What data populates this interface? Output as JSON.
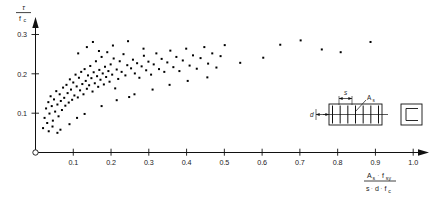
{
  "figure": {
    "background": "#ffffff",
    "ink": "#111111"
  },
  "axes": {
    "y_axis": {
      "label_numerator": "τ",
      "label_denominator": "f'c",
      "label_denominator_main": "f",
      "label_denominator_sub": "c",
      "ticks": [
        "0.1",
        "0.2",
        "0.3"
      ],
      "tick_values": [
        0.1,
        0.2,
        0.3
      ],
      "range": [
        0.0,
        0.33
      ],
      "arrow": true
    },
    "x_axis": {
      "label_num_a": "A",
      "label_num_a_sub": "s",
      "label_num_dot": "·",
      "label_num_f": "f",
      "label_num_f_sub": "sy",
      "label_den_s": "s",
      "label_den_d": "d",
      "label_den_f": "f",
      "label_den_f_sub": "c",
      "ticks": [
        "0.1",
        "0.2",
        "0.3",
        "0.4",
        "0.5",
        "0.6",
        "0.7",
        "0.8",
        "0.9",
        "1.0"
      ],
      "tick_values": [
        0.1,
        0.2,
        0.3,
        0.4,
        0.5,
        0.6,
        0.7,
        0.8,
        0.9,
        1.0
      ],
      "range": [
        0.0,
        1.05
      ],
      "arrow": true
    },
    "origin_marker": "open-circle"
  },
  "inset": {
    "spacing_label": "s",
    "area_label_main": "A",
    "area_label_sub": "s",
    "depth_label": "d",
    "stirrup_count": 7,
    "description": "beam elevation with stirrups and square cross-section"
  },
  "chart_data": {
    "type": "scatter",
    "title": "",
    "xlabel": "As · fsy / (s · d · f'c)",
    "ylabel": "τ / f'c",
    "xlim": [
      0.0,
      1.05
    ],
    "ylim": [
      0.0,
      0.33
    ],
    "grid": false,
    "legend": null,
    "marker": "square",
    "marker_size_px": 2.0,
    "series": [
      {
        "name": "test data",
        "color": "#000000",
        "points": [
          [
            0.02,
            0.062
          ],
          [
            0.024,
            0.088
          ],
          [
            0.028,
            0.112
          ],
          [
            0.031,
            0.075
          ],
          [
            0.034,
            0.128
          ],
          [
            0.037,
            0.099
          ],
          [
            0.04,
            0.143
          ],
          [
            0.043,
            0.118
          ],
          [
            0.046,
            0.081
          ],
          [
            0.049,
            0.135
          ],
          [
            0.052,
            0.104
          ],
          [
            0.055,
            0.156
          ],
          [
            0.058,
            0.122
          ],
          [
            0.061,
            0.092
          ],
          [
            0.064,
            0.148
          ],
          [
            0.067,
            0.131
          ],
          [
            0.07,
            0.108
          ],
          [
            0.073,
            0.165
          ],
          [
            0.076,
            0.139
          ],
          [
            0.079,
            0.119
          ],
          [
            0.082,
            0.172
          ],
          [
            0.085,
            0.151
          ],
          [
            0.088,
            0.127
          ],
          [
            0.091,
            0.186
          ],
          [
            0.094,
            0.16
          ],
          [
            0.097,
            0.134
          ],
          [
            0.1,
            0.178
          ],
          [
            0.103,
            0.145
          ],
          [
            0.106,
            0.198
          ],
          [
            0.109,
            0.168
          ],
          [
            0.112,
            0.14
          ],
          [
            0.115,
            0.19
          ],
          [
            0.118,
            0.158
          ],
          [
            0.121,
            0.205
          ],
          [
            0.124,
            0.174
          ],
          [
            0.127,
            0.148
          ],
          [
            0.13,
            0.212
          ],
          [
            0.133,
            0.182
          ],
          [
            0.136,
            0.162
          ],
          [
            0.139,
            0.196
          ],
          [
            0.142,
            0.171
          ],
          [
            0.145,
            0.22
          ],
          [
            0.148,
            0.189
          ],
          [
            0.151,
            0.155
          ],
          [
            0.154,
            0.204
          ],
          [
            0.157,
            0.176
          ],
          [
            0.16,
            0.232
          ],
          [
            0.163,
            0.194
          ],
          [
            0.166,
            0.167
          ],
          [
            0.169,
            0.21
          ],
          [
            0.172,
            0.185
          ],
          [
            0.175,
            0.243
          ],
          [
            0.178,
            0.201
          ],
          [
            0.181,
            0.173
          ],
          [
            0.184,
            0.218
          ],
          [
            0.187,
            0.192
          ],
          [
            0.19,
            0.255
          ],
          [
            0.193,
            0.207
          ],
          [
            0.196,
            0.18
          ],
          [
            0.199,
            0.224
          ],
          [
            0.203,
            0.198
          ],
          [
            0.207,
            0.239
          ],
          [
            0.211,
            0.163
          ],
          [
            0.215,
            0.211
          ],
          [
            0.219,
            0.187
          ],
          [
            0.223,
            0.232
          ],
          [
            0.228,
            0.205
          ],
          [
            0.233,
            0.25
          ],
          [
            0.238,
            0.196
          ],
          [
            0.243,
            0.222
          ],
          [
            0.248,
            0.141
          ],
          [
            0.253,
            0.214
          ],
          [
            0.258,
            0.236
          ],
          [
            0.263,
            0.201
          ],
          [
            0.269,
            0.227
          ],
          [
            0.275,
            0.19
          ],
          [
            0.281,
            0.219
          ],
          [
            0.287,
            0.246
          ],
          [
            0.293,
            0.209
          ],
          [
            0.299,
            0.231
          ],
          [
            0.306,
            0.198
          ],
          [
            0.313,
            0.224
          ],
          [
            0.32,
            0.252
          ],
          [
            0.327,
            0.212
          ],
          [
            0.334,
            0.238
          ],
          [
            0.341,
            0.205
          ],
          [
            0.349,
            0.229
          ],
          [
            0.357,
            0.259
          ],
          [
            0.365,
            0.217
          ],
          [
            0.373,
            0.243
          ],
          [
            0.381,
            0.207
          ],
          [
            0.39,
            0.234
          ],
          [
            0.399,
            0.264
          ],
          [
            0.408,
            0.221
          ],
          [
            0.417,
            0.247
          ],
          [
            0.427,
            0.213
          ],
          [
            0.437,
            0.24
          ],
          [
            0.447,
            0.268
          ],
          [
            0.457,
            0.226
          ],
          [
            0.468,
            0.252
          ],
          [
            0.479,
            0.216
          ],
          [
            0.49,
            0.245
          ],
          [
            0.501,
            0.273
          ],
          [
            0.113,
            0.252
          ],
          [
            0.136,
            0.268
          ],
          [
            0.152,
            0.281
          ],
          [
            0.168,
            0.258
          ],
          [
            0.205,
            0.272
          ],
          [
            0.245,
            0.283
          ],
          [
            0.286,
            0.264
          ],
          [
            0.058,
            0.05
          ],
          [
            0.066,
            0.058
          ],
          [
            0.045,
            0.066
          ],
          [
            0.035,
            0.054
          ],
          [
            0.09,
            0.072
          ],
          [
            0.11,
            0.088
          ],
          [
            0.13,
            0.098
          ],
          [
            0.175,
            0.118
          ],
          [
            0.215,
            0.133
          ],
          [
            0.262,
            0.148
          ],
          [
            0.31,
            0.16
          ],
          [
            0.355,
            0.172
          ],
          [
            0.403,
            0.182
          ],
          [
            0.455,
            0.191
          ],
          [
            0.542,
            0.228
          ],
          [
            0.603,
            0.241
          ],
          [
            0.648,
            0.274
          ],
          [
            0.702,
            0.285
          ],
          [
            0.758,
            0.262
          ],
          [
            0.808,
            0.255
          ],
          [
            0.887,
            0.281
          ]
        ]
      }
    ]
  }
}
